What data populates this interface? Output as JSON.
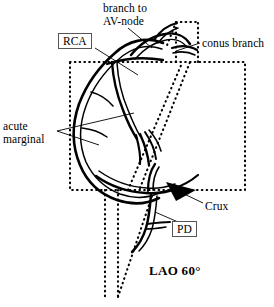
{
  "figure": {
    "view_label": "LAO 60°",
    "ink_color": "#000000",
    "background_color": "#ffffff",
    "box_border_color": "#555555"
  },
  "labels": {
    "branch_to_av_node_line1": "branch to",
    "branch_to_av_node_line2": "AV-node",
    "conus_branch": "conus branch",
    "acute_line1": "acute",
    "acute_line2": "marginal",
    "crux": "Crux",
    "rca": "RCA",
    "pd": "PD"
  },
  "icons": {
    "crux_pointer": "solid-arrowhead-icon"
  }
}
